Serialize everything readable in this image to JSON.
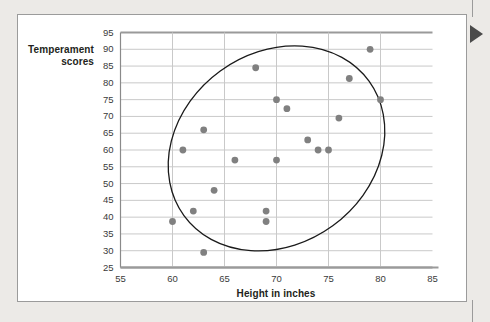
{
  "figure": {
    "background_color": "#eceae7",
    "card_color": "#ffffff",
    "card_border_color": "#9b9b9b",
    "pointer_color": "#4a4a4a"
  },
  "chart_data": {
    "type": "scatter",
    "title": "",
    "xlabel": "Height in inches",
    "ylabel": "Temperament scores",
    "xlim": [
      55,
      85
    ],
    "ylim": [
      25,
      95
    ],
    "xticks": [
      55,
      60,
      65,
      70,
      75,
      80,
      85
    ],
    "yticks": [
      25,
      30,
      35,
      40,
      45,
      50,
      55,
      60,
      65,
      70,
      75,
      80,
      85,
      90,
      95
    ],
    "grid": true,
    "grid_color": "#c9c9c9",
    "legend": "none",
    "point_color": "#808080",
    "point_radius": 3.4,
    "x": [
      60,
      61,
      62,
      63,
      63,
      64,
      66,
      68,
      69,
      69,
      70,
      70,
      71,
      73,
      74,
      75,
      76,
      77,
      79,
      80
    ],
    "y": [
      38.7,
      60.0,
      41.8,
      29.5,
      66.0,
      48.0,
      57.0,
      84.5,
      41.8,
      38.7,
      75.0,
      57.0,
      72.3,
      63.0,
      60.0,
      60.0,
      69.5,
      81.3,
      90.0,
      75.0
    ],
    "annotations": [
      {
        "type": "ellipse",
        "name": "correlation-ellipse",
        "center_x": 70.0,
        "center_y": 60.5,
        "width": 22.0,
        "height": 57.0,
        "rotation_deg": -36,
        "stroke": "#1a1a1a",
        "fill": "none"
      }
    ]
  },
  "axis_titles": {
    "y": "Temperament scores",
    "x": "Height in inches"
  }
}
